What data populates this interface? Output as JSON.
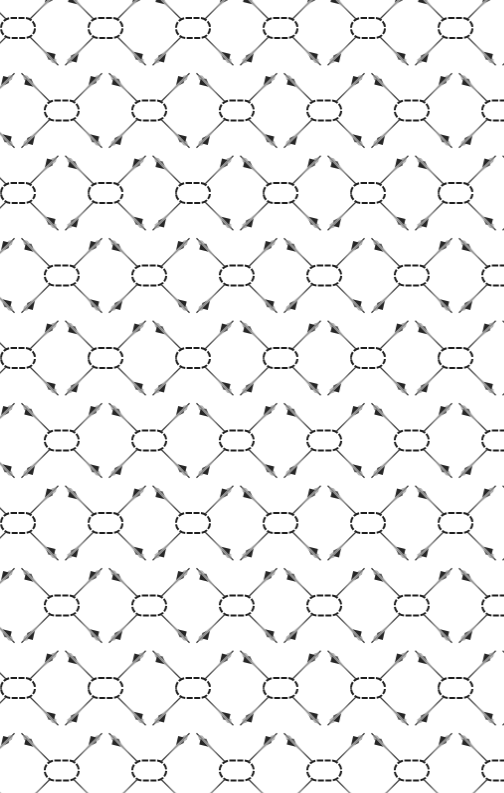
{
  "image": {
    "kind": "repeating-decorative-pattern",
    "background_color": "#ffffff",
    "motif": {
      "name": "oval-link-with-four-fin-arms",
      "link_color": "#1e1e1e",
      "fin_color": "#262626",
      "arm_shade_color": "#bdbdbd",
      "link_width": 33,
      "link_height": 20,
      "arm_length": 40
    },
    "grid": {
      "column_spacing": 87.5,
      "row_spacing": 82.5,
      "alternate_row_offset": 43.75,
      "first_row_y": 28,
      "first_row_x": 18,
      "rows": 10,
      "columns_per_row": 6
    }
  }
}
